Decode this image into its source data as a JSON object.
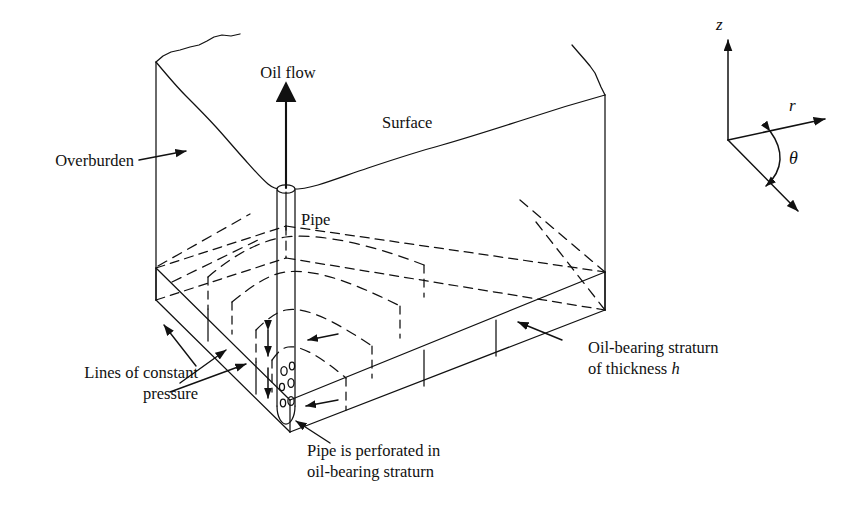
{
  "figure": {
    "kind": "engineering-schematic",
    "colors": {
      "ink": "#111111",
      "background": "#ffffff"
    }
  },
  "labels": {
    "oil_flow": "Oil flow",
    "surface": "Surface",
    "overburden": "Overburden",
    "pipe": "Pipe",
    "lines_of_constant_pressure_line1": "Lines of constant",
    "lines_of_constant_pressure_line2": "pressure",
    "perforated_line1": "Pipe is perforated in",
    "perforated_line2": "oil-bearing straturn",
    "stratum_line1": "Oil-bearing straturn",
    "stratum_line2_prefix": "of thickness ",
    "stratum_line2_symbol": "h"
  },
  "axes": {
    "z_label": "z",
    "r_label": "r",
    "theta_label": "θ",
    "origin": {
      "x": 728,
      "y": 140
    },
    "z_tip": {
      "x": 728,
      "y": 35
    },
    "r_tip": {
      "x": 829,
      "y": 117
    },
    "theta_axis_tip": {
      "x": 802,
      "y": 215
    }
  },
  "geometry": {
    "overburden_left_edge_x": 156,
    "overburden_right_edge_x": 605,
    "stratum_top_left_y": 268,
    "stratum_bottom_left_y": 300,
    "pipe_top_y": 188,
    "pipe_bottom_y": 412,
    "pipe_center_x": 286,
    "perforation_count": 6,
    "pressure_arc_count": 4,
    "arrow_count_constant_pressure": 3
  }
}
